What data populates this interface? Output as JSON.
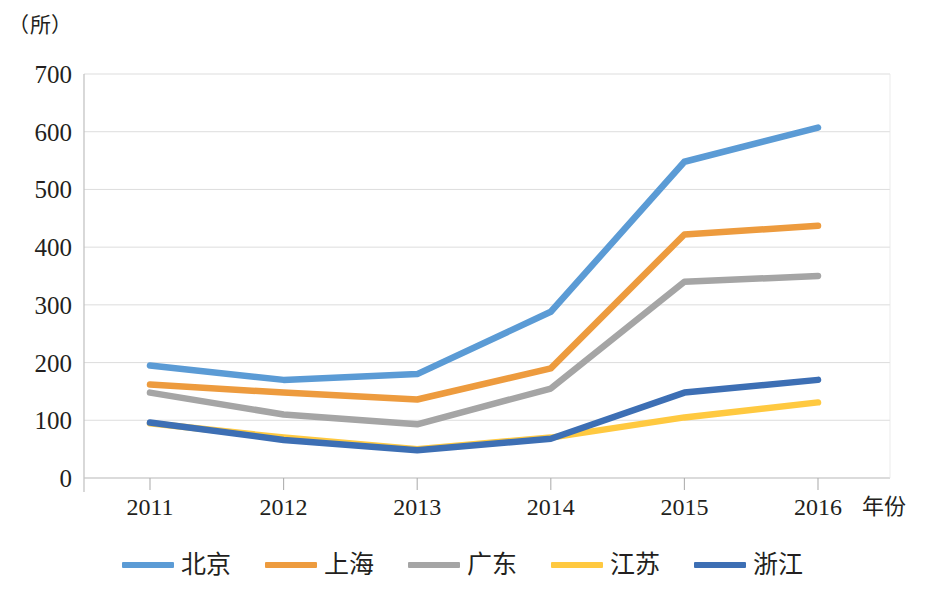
{
  "chart_data": {
    "type": "line",
    "title": "",
    "subtitle": "",
    "xlabel": "年份",
    "ylabel": "（所）",
    "yunit": "（所）",
    "categories": [
      "2011",
      "2012",
      "2013",
      "2014",
      "2015",
      "2016"
    ],
    "x": [
      2011,
      2012,
      2013,
      2014,
      2015,
      2016
    ],
    "ylim": [
      0,
      700
    ],
    "ytick_step": 100,
    "yticks": [
      "0",
      "100",
      "200",
      "300",
      "400",
      "500",
      "600",
      "700"
    ],
    "ytick_values": [
      0,
      100,
      200,
      300,
      400,
      500,
      600,
      700
    ],
    "grid": "horizontal",
    "legend_position": "bottom",
    "series": [
      {
        "name": "北京",
        "color": "#5B9BD5",
        "values": [
          195,
          170,
          180,
          288,
          548,
          607
        ]
      },
      {
        "name": "上海",
        "color": "#ED9B3E",
        "values": [
          162,
          148,
          136,
          190,
          422,
          437
        ]
      },
      {
        "name": "广东",
        "color": "#A5A5A5",
        "values": [
          148,
          110,
          93,
          155,
          340,
          350
        ]
      },
      {
        "name": "江苏",
        "color": "#FFC940",
        "values": [
          95,
          70,
          50,
          70,
          105,
          131
        ]
      },
      {
        "name": "浙江",
        "color": "#3D6FB4",
        "values": [
          96,
          66,
          48,
          68,
          148,
          170
        ]
      }
    ]
  },
  "axis": {
    "unit_label": "（所）",
    "x_title": "年份"
  }
}
